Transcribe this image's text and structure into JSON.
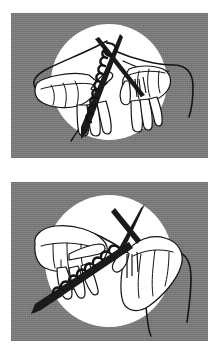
{
  "document": {
    "title": "Knitting Technique Illustration",
    "type": "instructional-illustration-pair",
    "background_color": "#ffffff",
    "width": 220,
    "height": 353
  },
  "palette": {
    "page_background": "#ffffff",
    "panel_background": "#7d7d7d",
    "vignette_fill": "#ffffff",
    "ink": "#111111",
    "needle_fill": "#1a1a1a",
    "yarn_stroke": "#151515"
  },
  "panels": [
    {
      "id": "panel-1",
      "index": 1,
      "caption": "",
      "background_color": "#7d7d7d",
      "vignette": {
        "shape": "circle",
        "fill": "#ffffff",
        "cx": 98,
        "cy": 69,
        "rx": 58,
        "ry": 58
      },
      "scene": {
        "subject": "two hands holding crossed knitting needles",
        "needle_count": 2,
        "needles_crossed": true,
        "stitches_on_needle": 9,
        "yarn_strands_visible": 3,
        "hands": [
          "left-hand",
          "right-hand"
        ],
        "view": "front",
        "description": "Both hands hold knitting needles crossed near the top with a column of cast-on stitches; loose yarn tails trail down-left and out to the right."
      }
    },
    {
      "id": "panel-2",
      "index": 2,
      "caption": "",
      "background_color": "#7d7d7d",
      "vignette": {
        "shape": "ellipse",
        "fill": "#ffffff",
        "cx": 98,
        "cy": 79,
        "rx": 64,
        "ry": 66
      },
      "scene": {
        "subject": "left hand holding needle while right hand wraps yarn",
        "needle_count": 2,
        "needles_crossed": true,
        "stitches_on_needle": 8,
        "yarn_strands_visible": 3,
        "hands": [
          "left-hand",
          "right-hand"
        ],
        "view": "three-quarter",
        "description": "The left hand grips the needle with the row of stitches horizontally while the right hand reaches in from the right to guide the working yarn over the crossed needle tips."
      }
    }
  ],
  "icons": {
    "knitting-needle": "needle-icon",
    "yarn-strand": "yarn-icon",
    "hand": "hand-icon",
    "stitch": "stitch-icon"
  }
}
